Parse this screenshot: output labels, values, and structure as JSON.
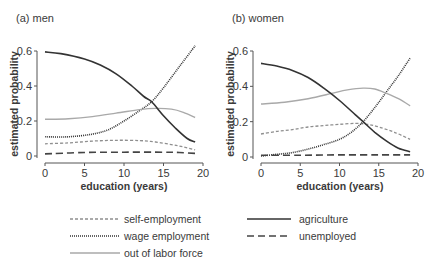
{
  "chart_data": [
    {
      "type": "line",
      "title": "(a) men",
      "xlabel": "education (years)",
      "ylabel": "estimated probability",
      "xlim": [
        0,
        20
      ],
      "ylim": [
        0,
        0.6
      ],
      "xticks": [
        0,
        5,
        10,
        15,
        20
      ],
      "yticks": [
        0,
        0.2,
        0.4,
        0.6
      ],
      "ytick_labels": [
        "0",
        "0.2",
        "0.4",
        "0.6"
      ],
      "grid": false,
      "series": [
        {
          "name": "self-employment",
          "x": [
            0,
            3,
            6,
            9,
            12,
            14,
            16,
            17.5,
            19
          ],
          "values": [
            0.07,
            0.075,
            0.085,
            0.09,
            0.088,
            0.08,
            0.065,
            0.052,
            0.035
          ]
        },
        {
          "name": "wage employment",
          "x": [
            0,
            3,
            6,
            8,
            10,
            12,
            13.5,
            15,
            17,
            19
          ],
          "values": [
            0.11,
            0.11,
            0.125,
            0.15,
            0.2,
            0.26,
            0.31,
            0.39,
            0.51,
            0.63
          ]
        },
        {
          "name": "out of labor force",
          "x": [
            0,
            3,
            6,
            9,
            12,
            14,
            16,
            17.5,
            19
          ],
          "values": [
            0.21,
            0.213,
            0.225,
            0.245,
            0.265,
            0.272,
            0.268,
            0.25,
            0.22
          ]
        },
        {
          "name": "agriculture",
          "x": [
            0,
            2,
            5,
            7,
            9,
            11,
            12.5,
            13.5,
            15,
            16.5,
            18,
            19
          ],
          "values": [
            0.595,
            0.585,
            0.555,
            0.52,
            0.47,
            0.4,
            0.34,
            0.31,
            0.23,
            0.16,
            0.1,
            0.08
          ]
        },
        {
          "name": "unemployed",
          "x": [
            0,
            5,
            10,
            15,
            17,
            19
          ],
          "values": [
            0.012,
            0.02,
            0.022,
            0.022,
            0.02,
            0.015
          ]
        }
      ]
    },
    {
      "type": "line",
      "title": "(b) women",
      "xlabel": "education (years)",
      "ylabel": "estimated probability",
      "xlim": [
        0,
        20
      ],
      "ylim": [
        0,
        0.6
      ],
      "xticks": [
        0,
        5,
        10,
        15,
        20
      ],
      "yticks": [
        0,
        0.2,
        0.4,
        0.6
      ],
      "ytick_labels": [
        "0",
        "0.2",
        "0.4",
        "0.6"
      ],
      "grid": false,
      "series": [
        {
          "name": "self-employment",
          "x": [
            0,
            2,
            4,
            6,
            8,
            10,
            12,
            13.5,
            15,
            17,
            19
          ],
          "values": [
            0.13,
            0.145,
            0.155,
            0.17,
            0.178,
            0.185,
            0.19,
            0.185,
            0.17,
            0.14,
            0.1
          ]
        },
        {
          "name": "wage employment",
          "x": [
            0,
            2,
            4,
            6,
            8,
            10,
            11.5,
            13,
            14.5,
            16,
            17.5,
            19
          ],
          "values": [
            0.005,
            0.015,
            0.025,
            0.045,
            0.07,
            0.1,
            0.14,
            0.2,
            0.28,
            0.37,
            0.46,
            0.56
          ]
        },
        {
          "name": "out of labor force",
          "x": [
            0,
            3,
            6,
            9,
            11,
            13,
            14.5,
            16,
            17.5,
            19
          ],
          "values": [
            0.3,
            0.31,
            0.33,
            0.36,
            0.38,
            0.39,
            0.385,
            0.36,
            0.33,
            0.29
          ]
        },
        {
          "name": "agriculture",
          "x": [
            0,
            2,
            4,
            6,
            8,
            10,
            12,
            13,
            14.5,
            16,
            17.5,
            19
          ],
          "values": [
            0.53,
            0.515,
            0.49,
            0.45,
            0.39,
            0.32,
            0.24,
            0.2,
            0.14,
            0.09,
            0.05,
            0.03
          ]
        },
        {
          "name": "unemployed",
          "x": [
            0,
            5,
            10,
            15,
            19
          ],
          "values": [
            0.01,
            0.01,
            0.012,
            0.012,
            0.012
          ]
        }
      ]
    }
  ],
  "panels": [
    {
      "title": "(a) men",
      "xlabel": "education (years)",
      "ylabel": "estimated probability"
    },
    {
      "title": "(b) women",
      "xlabel": "education (years)",
      "ylabel": "estimated probability"
    }
  ],
  "legend": {
    "position": "bottom",
    "items": [
      {
        "name": "self-employment",
        "style": "dashed-fine",
        "color": "#8a8a8a"
      },
      {
        "name": "wage employment",
        "style": "dotted",
        "color": "#333333"
      },
      {
        "name": "out of labor force",
        "style": "solid",
        "color": "#a8a8a8"
      },
      {
        "name": "agriculture",
        "style": "solid",
        "color": "#333333"
      },
      {
        "name": "unemployed",
        "style": "dashed-long",
        "color": "#444444"
      }
    ]
  },
  "styles": {
    "self-employment": {
      "color": "#8f8f8f",
      "width": 1.3,
      "dash": "3,2"
    },
    "wage employment": {
      "color": "#333333",
      "width": 1.6,
      "dash": "1,1"
    },
    "out of labor force": {
      "color": "#a9a9a9",
      "width": 1.4,
      "dash": ""
    },
    "agriculture": {
      "color": "#333333",
      "width": 1.6,
      "dash": ""
    },
    "unemployed": {
      "color": "#444444",
      "width": 1.6,
      "dash": "7,4"
    }
  }
}
